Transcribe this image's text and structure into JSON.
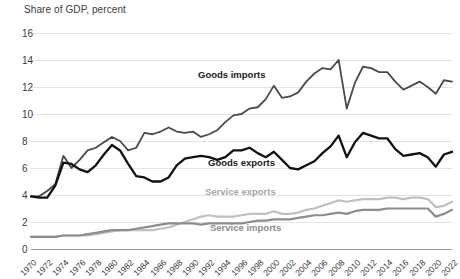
{
  "chart_data": {
    "type": "line",
    "title": "Share of GDP, percent",
    "xlabel": "",
    "ylabel": "Share of GDP, percent",
    "ylim": [
      0,
      16
    ],
    "ytick_step": 2,
    "yticks": [
      "0",
      "2",
      "4",
      "6",
      "8",
      "10",
      "12",
      "14",
      "16"
    ],
    "xlim": [
      1970,
      2022
    ],
    "xtick_step": 2,
    "grid": true,
    "legend_position": "inline-annotations",
    "x": [
      1970,
      1971,
      1972,
      1973,
      1974,
      1975,
      1976,
      1977,
      1978,
      1979,
      1980,
      1981,
      1982,
      1983,
      1984,
      1985,
      1986,
      1987,
      1988,
      1989,
      1990,
      1991,
      1992,
      1993,
      1994,
      1995,
      1996,
      1997,
      1998,
      1999,
      2000,
      2001,
      2002,
      2003,
      2004,
      2005,
      2006,
      2007,
      2008,
      2009,
      2010,
      2011,
      2012,
      2013,
      2014,
      2015,
      2016,
      2017,
      2018,
      2019,
      2020,
      2021,
      2022
    ],
    "xtick_labels": [
      "1970",
      "1972",
      "1974",
      "1976",
      "1978",
      "1980",
      "1982",
      "1984",
      "1986",
      "1988",
      "1990",
      "1992",
      "1994",
      "1996",
      "1998",
      "2000",
      "2002",
      "2004",
      "2006",
      "2008",
      "2010",
      "2012",
      "2014",
      "2016",
      "2018",
      "2020",
      "2022"
    ],
    "series": [
      {
        "name": "Goods imports",
        "color": "#4a4a4a",
        "width": 1.8,
        "values": [
          3.9,
          3.9,
          4.3,
          4.8,
          6.9,
          6.0,
          6.6,
          7.3,
          7.5,
          7.9,
          8.3,
          8.0,
          7.3,
          7.5,
          8.6,
          8.5,
          8.7,
          9.0,
          8.7,
          8.6,
          8.7,
          8.3,
          8.5,
          8.8,
          9.4,
          9.9,
          10.0,
          10.4,
          10.5,
          11.1,
          12.1,
          11.2,
          11.3,
          11.6,
          12.4,
          13.0,
          13.4,
          13.3,
          14.0,
          10.4,
          12.3,
          13.5,
          13.4,
          13.1,
          13.1,
          12.4,
          11.8,
          12.1,
          12.4,
          12.0,
          11.5,
          12.5,
          12.4
        ]
      },
      {
        "name": "Goods exports",
        "color": "#111111",
        "width": 2.3,
        "values": [
          3.9,
          3.8,
          3.8,
          4.7,
          6.4,
          6.3,
          5.9,
          5.7,
          6.2,
          7.0,
          7.7,
          7.3,
          6.3,
          5.4,
          5.3,
          5.0,
          5.0,
          5.3,
          6.2,
          6.7,
          6.8,
          6.9,
          6.8,
          6.6,
          6.8,
          7.3,
          7.3,
          7.5,
          7.1,
          6.8,
          7.2,
          6.6,
          6.0,
          5.9,
          6.2,
          6.5,
          7.1,
          7.6,
          8.4,
          6.8,
          7.9,
          8.6,
          8.4,
          8.2,
          8.2,
          7.4,
          6.9,
          7.0,
          7.1,
          6.8,
          6.1,
          7.0,
          7.2
        ]
      },
      {
        "name": "Service exports",
        "color": "#c0c0c0",
        "width": 2.2,
        "values": [
          0.9,
          0.9,
          0.9,
          0.9,
          1.0,
          1.0,
          1.0,
          1.0,
          1.1,
          1.2,
          1.3,
          1.4,
          1.4,
          1.4,
          1.4,
          1.4,
          1.5,
          1.6,
          1.8,
          2.0,
          2.2,
          2.4,
          2.5,
          2.4,
          2.4,
          2.4,
          2.5,
          2.6,
          2.6,
          2.6,
          2.8,
          2.6,
          2.6,
          2.7,
          2.9,
          3.0,
          3.2,
          3.4,
          3.6,
          3.5,
          3.6,
          3.7,
          3.7,
          3.7,
          3.8,
          3.8,
          3.7,
          3.8,
          3.8,
          3.7,
          3.1,
          3.2,
          3.5
        ]
      },
      {
        "name": "Service imports",
        "color": "#8d8d8d",
        "width": 2.2,
        "values": [
          0.9,
          0.9,
          0.9,
          0.9,
          1.0,
          1.0,
          1.0,
          1.1,
          1.2,
          1.3,
          1.4,
          1.4,
          1.4,
          1.5,
          1.6,
          1.7,
          1.8,
          1.9,
          1.9,
          1.9,
          1.9,
          1.8,
          1.9,
          1.9,
          1.9,
          1.9,
          1.9,
          2.0,
          2.1,
          2.1,
          2.2,
          2.2,
          2.2,
          2.3,
          2.4,
          2.5,
          2.5,
          2.6,
          2.7,
          2.6,
          2.8,
          2.9,
          2.9,
          2.9,
          3.0,
          3.0,
          3.0,
          3.0,
          3.0,
          3.0,
          2.4,
          2.6,
          2.9
        ]
      }
    ],
    "annotations": [
      {
        "text": "Goods imports",
        "x": 1994,
        "y": 12.3,
        "color": "#1a1a1a"
      },
      {
        "text": "Goods exports",
        "x": 1995,
        "y": 5.6,
        "color": "#1a1a1a"
      },
      {
        "text": "Service exports",
        "x": 1995,
        "y": 3.5,
        "color": "#a8a8a8"
      },
      {
        "text": "Service imports",
        "x": 1996,
        "y": 0.8,
        "color": "#8d8d8d"
      }
    ]
  }
}
